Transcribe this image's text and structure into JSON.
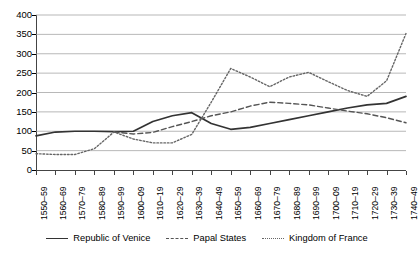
{
  "chart_data": {
    "type": "line",
    "title": "",
    "xlabel": "",
    "ylabel": "",
    "ylim": [
      0,
      400
    ],
    "ytick_step": 50,
    "grid": true,
    "legend_position": "bottom",
    "ytick_labels": [
      "400",
      "350",
      "300",
      "250",
      "200",
      "150",
      "100",
      "50",
      "0"
    ],
    "categories": [
      "1550–59",
      "1560–69",
      "1570–79",
      "1580–89",
      "1590–99",
      "1600–09",
      "1610–19",
      "1620–29",
      "1630–39",
      "1640–49",
      "1650–59",
      "1660–69",
      "1670–79",
      "1680–89",
      "1690–99",
      "1700–09",
      "1710–19",
      "1720–29",
      "1730–39",
      "1740–49"
    ],
    "series": [
      {
        "name": "Republic of Venice",
        "style": "solid",
        "color": "#333333",
        "values": [
          88,
          98,
          100,
          100,
          99,
          100,
          125,
          140,
          148,
          120,
          105,
          110,
          120,
          130,
          140,
          150,
          160,
          168,
          172,
          190
        ]
      },
      {
        "name": "Papal States",
        "style": "dashed",
        "color": "#555555",
        "values": [
          null,
          null,
          null,
          null,
          98,
          93,
          97,
          112,
          125,
          140,
          150,
          165,
          175,
          172,
          168,
          160,
          152,
          145,
          135,
          122
        ]
      },
      {
        "name": "Kingdom of France",
        "style": "dotted",
        "color": "#666666",
        "values": [
          42,
          40,
          40,
          55,
          98,
          80,
          70,
          70,
          92,
          175,
          262,
          240,
          215,
          240,
          252,
          228,
          205,
          190,
          230,
          352
        ]
      }
    ]
  },
  "legend": {
    "entries": [
      {
        "label": "Republic of Venice"
      },
      {
        "label": "Papal States"
      },
      {
        "label": "Kingdom of France"
      }
    ]
  }
}
